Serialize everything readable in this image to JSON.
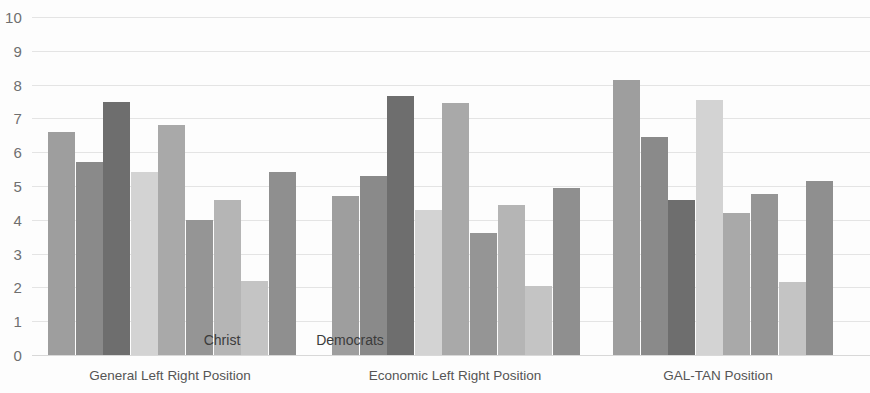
{
  "chart_data": {
    "type": "bar",
    "title": "",
    "xlabel": "",
    "ylabel": "",
    "ylim": [
      0,
      10
    ],
    "y_ticks": [
      0,
      1,
      2,
      3,
      4,
      5,
      6,
      7,
      8,
      9,
      10
    ],
    "grid": true,
    "legend": "none",
    "categories": [
      "General Left Right Position",
      "Economic Left Right Position",
      "GAL-TAN Position"
    ],
    "annotations": [
      {
        "text": "Christ",
        "x_px": 222,
        "y_value": 0.45
      },
      {
        "text": "Democrats",
        "x_px": 350,
        "y_value": 0.45
      }
    ],
    "groups": [
      {
        "name": "General Left Right Position",
        "bars": [
          {
            "value": 6.6,
            "color": "#9e9e9e"
          },
          {
            "value": 5.7,
            "color": "#8a8a8a"
          },
          {
            "value": 7.5,
            "color": "#6e6e6e"
          },
          {
            "value": 5.4,
            "color": "#d3d3d3"
          },
          {
            "value": 6.8,
            "color": "#a9a9a9"
          },
          {
            "value": 4.0,
            "color": "#959595"
          },
          {
            "value": 4.6,
            "color": "#b5b5b5"
          },
          {
            "value": 2.2,
            "color": "#c4c4c4"
          },
          {
            "value": 5.4,
            "color": "#8f8f8f"
          }
        ]
      },
      {
        "name": "Economic Left Right Position",
        "bars": [
          {
            "value": 4.7,
            "color": "#9e9e9e"
          },
          {
            "value": 5.3,
            "color": "#8a8a8a"
          },
          {
            "value": 7.65,
            "color": "#6e6e6e"
          },
          {
            "value": 4.3,
            "color": "#d3d3d3"
          },
          {
            "value": 7.45,
            "color": "#a9a9a9"
          },
          {
            "value": 3.6,
            "color": "#959595"
          },
          {
            "value": 4.45,
            "color": "#b5b5b5"
          },
          {
            "value": 2.05,
            "color": "#c4c4c4"
          },
          {
            "value": 4.95,
            "color": "#8f8f8f"
          }
        ]
      },
      {
        "name": "GAL-TAN Position",
        "bars": [
          {
            "value": 8.15,
            "color": "#9e9e9e"
          },
          {
            "value": 6.45,
            "color": "#8a8a8a"
          },
          {
            "value": 4.6,
            "color": "#6e6e6e"
          },
          {
            "value": 7.55,
            "color": "#d3d3d3"
          },
          {
            "value": 4.2,
            "color": "#a9a9a9"
          },
          {
            "value": 4.75,
            "color": "#959595"
          },
          {
            "value": 2.15,
            "color": "#c4c4c4"
          },
          {
            "value": 5.15,
            "color": "#8f8f8f"
          }
        ]
      }
    ],
    "layout": {
      "baseline_y_px": 355,
      "px_per_unit": 33.8,
      "bar_width_px": 27,
      "bar_gap_px": 0.6,
      "group_starts_px": [
        48,
        332,
        613
      ],
      "group_label_centers_px": [
        170,
        455,
        718
      ],
      "grid_color": "#e4e4e4",
      "tick_label_color": "#6f6f6f"
    }
  }
}
